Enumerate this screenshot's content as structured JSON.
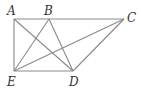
{
  "diagram": {
    "type": "geometry",
    "points": {
      "A": {
        "label": "A",
        "x": 14,
        "y": 19
      },
      "B": {
        "label": "B",
        "x": 49,
        "y": 19
      },
      "C": {
        "label": "C",
        "x": 124,
        "y": 19
      },
      "D": {
        "label": "D",
        "x": 73,
        "y": 71
      },
      "E": {
        "label": "E",
        "x": 14,
        "y": 71
      }
    },
    "segments": [
      "AC",
      "AE",
      "ED",
      "DC",
      "AD",
      "BE",
      "BD",
      "EC"
    ],
    "colors": {
      "line": "#8a8a8a",
      "label": "#333333"
    }
  }
}
